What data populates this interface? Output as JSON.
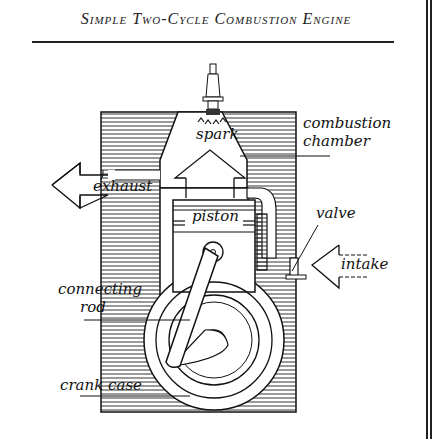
{
  "title": "Simple Two-Cycle Combustion Engine",
  "labels": {
    "spark": "spark",
    "combustion_chamber_line1": "combustion",
    "combustion_chamber_line2": "chamber",
    "exhaust": "exhaust",
    "piston": "piston",
    "valve": "valve",
    "intake": "intake",
    "connecting_rod_line1": "connecting",
    "connecting_rod_line2": "rod",
    "crank_case": "crank case"
  },
  "colors": {
    "ink": "#111111",
    "hatch": "#333333",
    "background": "#ffffff"
  }
}
